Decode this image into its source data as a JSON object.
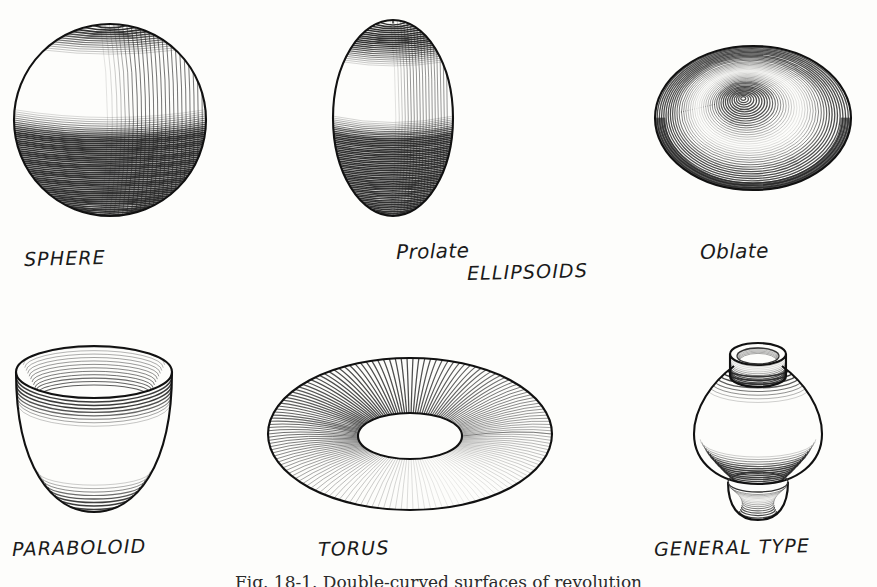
{
  "figure": {
    "caption": "Fig. 18-1. Double-curved surfaces of revolution",
    "background_color": "#fdfdfb",
    "ink_color": "#262626",
    "rendering_style": "engraved line-shading (contour hatching)"
  },
  "labels": {
    "sphere": "SPHERE",
    "prolate": "Prolate",
    "ellipsoids": "ELLIPSOIDS",
    "oblate": "Oblate",
    "paraboloid": "PARABOLOID",
    "torus": "TORUS",
    "general_type": "GENERAL TYPE"
  },
  "shapes": [
    {
      "name": "sphere",
      "label": "SPHERE",
      "row": 1,
      "column": 1,
      "description": "Sphere shaded with curved contour hatching, highlight at upper left"
    },
    {
      "name": "prolate-ellipsoid",
      "label": "Prolate",
      "row": 1,
      "column": 2,
      "description": "Egg-shaped prolate ellipsoid, major axis vertical"
    },
    {
      "name": "oblate-ellipsoid",
      "label": "Oblate",
      "row": 1,
      "column": 3,
      "description": "Flattened oblate ellipsoid seen from above"
    },
    {
      "name": "paraboloid",
      "label": "PARABOLOID",
      "row": 2,
      "column": 1,
      "description": "Open paraboloid bowl with visible elliptical rim"
    },
    {
      "name": "torus",
      "label": "TORUS",
      "row": 2,
      "column": 2,
      "description": "Ring torus in pictorial view with central hole"
    },
    {
      "name": "general-type",
      "label": "GENERAL TYPE",
      "row": 2,
      "column": 3,
      "description": "Vase-like solid of revolution with neck, bulbous body and flared foot"
    }
  ]
}
